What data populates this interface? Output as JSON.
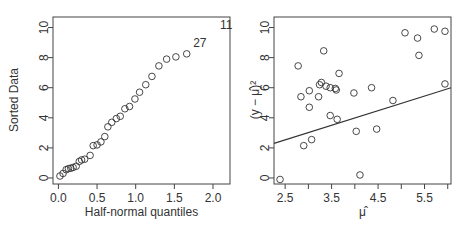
{
  "chart_data": [
    {
      "type": "scatter",
      "title": "",
      "xlabel": "Half-normal quantiles",
      "ylabel": "Sorted Data",
      "xlim": [
        -0.07,
        2.22
      ],
      "ylim": [
        -0.4,
        10.7
      ],
      "xticks": [
        0.0,
        0.5,
        1.0,
        1.5,
        2.0
      ],
      "xtick_labels": [
        "0.0",
        "0.5",
        "1.0",
        "1.5",
        "2.0"
      ],
      "yticks": [
        0,
        2,
        4,
        6,
        8,
        10
      ],
      "ytick_labels": [
        "0",
        "2",
        "4",
        "6",
        "8",
        "10"
      ],
      "grid": false,
      "legend": null,
      "points": [
        [
          0.02,
          0.13
        ],
        [
          0.06,
          0.3
        ],
        [
          0.1,
          0.55
        ],
        [
          0.13,
          0.62
        ],
        [
          0.16,
          0.65
        ],
        [
          0.19,
          0.7
        ],
        [
          0.23,
          0.78
        ],
        [
          0.27,
          1.1
        ],
        [
          0.3,
          1.2
        ],
        [
          0.34,
          1.25
        ],
        [
          0.41,
          1.5
        ],
        [
          0.45,
          2.15
        ],
        [
          0.5,
          2.2
        ],
        [
          0.55,
          2.4
        ],
        [
          0.6,
          2.75
        ],
        [
          0.64,
          3.4
        ],
        [
          0.69,
          3.7
        ],
        [
          0.75,
          3.95
        ],
        [
          0.8,
          4.1
        ],
        [
          0.86,
          4.6
        ],
        [
          0.92,
          4.75
        ],
        [
          0.99,
          5.25
        ],
        [
          1.05,
          5.7
        ],
        [
          1.13,
          6.2
        ],
        [
          1.21,
          6.75
        ],
        [
          1.3,
          7.45
        ],
        [
          1.4,
          7.9
        ],
        [
          1.52,
          8.05
        ],
        [
          1.66,
          8.25
        ]
      ],
      "annotations": [
        {
          "text": "27",
          "x": 1.83,
          "y": 8.95
        },
        {
          "text": "11",
          "x": 2.17,
          "y": 10.2
        }
      ]
    },
    {
      "type": "scatter",
      "title": "",
      "xlabel": "μ̂",
      "ylabel": "(y − μ̂)²",
      "xlim": [
        2.26,
        6.07
      ],
      "ylim": [
        -0.4,
        10.7
      ],
      "xticks": [
        2.5,
        3.0,
        3.5,
        4.0,
        4.5,
        5.0,
        5.5,
        6.0
      ],
      "xtick_labels": [
        "2.5",
        "",
        "3.5",
        "",
        "4.5",
        "",
        "5.5",
        ""
      ],
      "yticks": [
        0,
        2,
        4,
        6,
        8,
        10
      ],
      "ytick_labels": [
        "0",
        "2",
        "4",
        "6",
        "8",
        "10"
      ],
      "grid": false,
      "legend": null,
      "points": [
        [
          2.39,
          -0.1
        ],
        [
          2.78,
          7.45
        ],
        [
          2.84,
          5.4
        ],
        [
          2.9,
          2.15
        ],
        [
          3.02,
          5.8
        ],
        [
          3.02,
          4.7
        ],
        [
          3.07,
          2.55
        ],
        [
          3.22,
          5.4
        ],
        [
          3.24,
          6.2
        ],
        [
          3.28,
          6.35
        ],
        [
          3.33,
          8.45
        ],
        [
          3.38,
          6.1
        ],
        [
          3.47,
          6.0
        ],
        [
          3.47,
          4.15
        ],
        [
          3.58,
          5.95
        ],
        [
          3.6,
          5.85
        ],
        [
          3.62,
          3.9
        ],
        [
          3.66,
          6.95
        ],
        [
          3.98,
          5.65
        ],
        [
          4.03,
          3.1
        ],
        [
          4.11,
          0.2
        ],
        [
          4.36,
          6.0
        ],
        [
          4.47,
          3.25
        ],
        [
          4.82,
          5.15
        ],
        [
          5.08,
          9.65
        ],
        [
          5.35,
          9.3
        ],
        [
          5.38,
          8.15
        ],
        [
          5.71,
          9.9
        ],
        [
          5.94,
          9.75
        ],
        [
          5.94,
          6.25
        ]
      ],
      "fit_line": {
        "x1": 2.26,
        "y1": 2.3,
        "x2": 6.07,
        "y2": 6.0
      }
    }
  ],
  "colors": {
    "ink": "#333333",
    "frame": "#444444",
    "background": "#ffffff"
  }
}
